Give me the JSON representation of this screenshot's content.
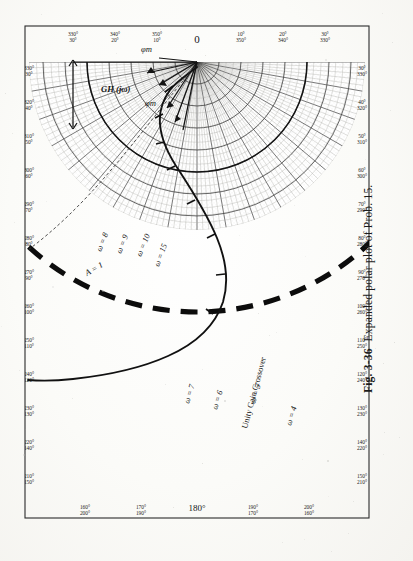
{
  "figure": {
    "number": "Fig. 3-36",
    "caption": "Expanded polar plot of Prob. 15.",
    "orientation": "rotated-180"
  },
  "chart_data": {
    "type": "scatter",
    "subtype": "polar-nyquist-locus",
    "title": "Expanded polar plot of Prob. 15.",
    "xlabel": "",
    "ylabel": "",
    "grid": true,
    "legend": false,
    "polar": {
      "angle_unit": "degrees",
      "angle_center_top": "0",
      "angle_center_bottom": "180°",
      "radial_gridlines_deg": 10,
      "radial_minor_deg": 2,
      "magnitude_rings": 10,
      "magnitude_minor_rings": 50
    },
    "axis_labels_top": [
      "0"
    ],
    "axis_labels_bottom": [
      "180°"
    ],
    "axis_labels_left": [
      {
        "outer": "330°",
        "inner": "30°"
      },
      {
        "outer": "320°",
        "inner": "40°"
      },
      {
        "outer": "310°",
        "inner": "50°"
      },
      {
        "outer": "300°",
        "inner": "60°"
      },
      {
        "outer": "290°",
        "inner": "70°"
      },
      {
        "outer": "280°",
        "inner": "80°"
      },
      {
        "outer": "270°",
        "inner": "90°"
      },
      {
        "outer": "260°",
        "inner": "100°"
      },
      {
        "outer": "250°",
        "inner": "110°"
      },
      {
        "outer": "240°",
        "inner": "120°"
      },
      {
        "outer": "230°",
        "inner": "130°"
      },
      {
        "outer": "220°",
        "inner": "140°"
      },
      {
        "outer": "210°",
        "inner": "150°"
      }
    ],
    "axis_labels_right": [
      {
        "outer": "30°",
        "inner": "330°"
      },
      {
        "outer": "40°",
        "inner": "320°"
      },
      {
        "outer": "50°",
        "inner": "310°"
      },
      {
        "outer": "60°",
        "inner": "300°"
      },
      {
        "outer": "70°",
        "inner": "290°"
      },
      {
        "outer": "80°",
        "inner": "280°"
      },
      {
        "outer": "90°",
        "inner": "270°"
      },
      {
        "outer": "100°",
        "inner": "260°"
      },
      {
        "outer": "110°",
        "inner": "250°"
      },
      {
        "outer": "120°",
        "inner": "240°"
      },
      {
        "outer": "130°",
        "inner": "230°"
      },
      {
        "outer": "140°",
        "inner": "220°"
      },
      {
        "outer": "150°",
        "inner": "210°"
      }
    ],
    "axis_labels_top_row": [
      {
        "outer": "330°",
        "inner": "30°"
      },
      {
        "outer": "340°",
        "inner": "20°"
      },
      {
        "outer": "350°",
        "inner": "10°"
      },
      {
        "outer": "0",
        "inner": ""
      },
      {
        "outer": "10°",
        "inner": "350°"
      },
      {
        "outer": "20°",
        "inner": "340°"
      },
      {
        "outer": "30°",
        "inner": "330°"
      }
    ],
    "axis_labels_bottom_row": [
      {
        "outer": "200°",
        "inner": "160°"
      },
      {
        "outer": "190°",
        "inner": "170°"
      },
      {
        "outer": "180°",
        "inner": ""
      },
      {
        "outer": "170°",
        "inner": "190°"
      },
      {
        "outer": "160°",
        "inner": "200°"
      }
    ],
    "frequency_markers": [
      {
        "label": "ω = 4",
        "omega": 4
      },
      {
        "label": "ω = 5",
        "omega": 5
      },
      {
        "label": "ω = 6",
        "omega": 6
      },
      {
        "label": "ω = 7",
        "omega": 7
      },
      {
        "label": "ω = 8",
        "omega": 8
      },
      {
        "label": "ω = 9",
        "omega": 9
      },
      {
        "label": "ω = 10",
        "omega": 10
      },
      {
        "label": "ω = 15",
        "omega": 15
      }
    ],
    "annotations": [
      {
        "name": "unity-gain-circle-label",
        "text": "A = 1"
      },
      {
        "name": "unity-gain-crossover",
        "text": "Unity Gain Crossover"
      },
      {
        "name": "phase-margin-upper",
        "text": "φm"
      },
      {
        "name": "phase-margin-lower",
        "text": "φm"
      },
      {
        "name": "transfer-function-vector",
        "text": "GH (jω)"
      }
    ],
    "colors": {
      "ink": "#1a1a1a",
      "grid_major": "#3a3a3a",
      "grid_minor": "#9a9a96",
      "paper": "#fbfbf8",
      "locus": "#111111",
      "unity_circle": "#0d0d0d"
    }
  }
}
